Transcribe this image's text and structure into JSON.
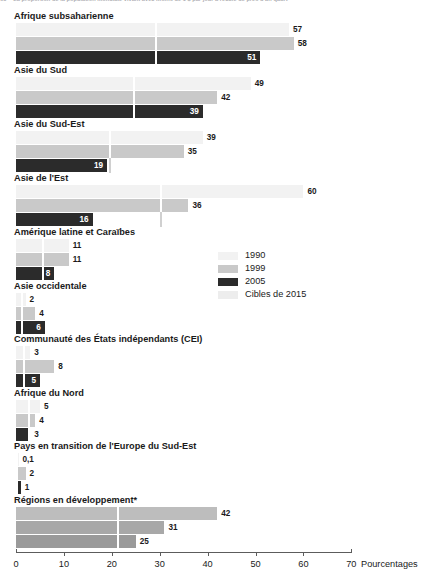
{
  "page": {
    "running_head_folio": "68",
    "running_head_text": "La proportion de la population mondiale vivant avec moins de 1 $ par jour a reculé de près d'un quart"
  },
  "chart_data": {
    "type": "bar",
    "orientation": "horizontal",
    "title": "",
    "xlabel": "Pourcentages",
    "ylabel": "",
    "xlim": [
      0,
      70
    ],
    "xticks": [
      0,
      10,
      20,
      30,
      40,
      50,
      60,
      70
    ],
    "xtick_labels": [
      "0",
      "10",
      "20",
      "30",
      "40",
      "50",
      "60",
      "70"
    ],
    "grid": false,
    "legend_position": "middle-right",
    "series": [
      {
        "name": "1990",
        "color": "#f2f2f2"
      },
      {
        "name": "1999",
        "color": "#c9c9c9"
      },
      {
        "name": "2005",
        "color": "#2b2b2b"
      }
    ],
    "target_marker": {
      "name": "Cibles de 2015",
      "color": "#ededed"
    },
    "categories": [
      "Afrique subsaharienne",
      "Asie du Sud",
      "Asie du Sud-Est",
      "Asie de l'Est",
      "Amérique latine et Caraïbes",
      "Asie occidentale",
      "Communauté des États indépendants (CEI)",
      "Afrique du Nord",
      "Pays en transition de l'Europe du Sud-Est",
      "Régions en développement*"
    ],
    "groups": [
      {
        "label": "Afrique subsaharienne",
        "target": 29,
        "highlight": false,
        "bars": [
          {
            "series": "1990",
            "value": 57,
            "label": "57"
          },
          {
            "series": "1999",
            "value": 58,
            "label": "58"
          },
          {
            "series": "2005",
            "value": 51,
            "label": "51"
          }
        ]
      },
      {
        "label": "Asie du Sud",
        "target": 24.5,
        "highlight": false,
        "bars": [
          {
            "series": "1990",
            "value": 49,
            "label": "49"
          },
          {
            "series": "1999",
            "value": 42,
            "label": "42"
          },
          {
            "series": "2005",
            "value": 39,
            "label": "39"
          }
        ]
      },
      {
        "label": "Asie du Sud-Est",
        "target": 19.5,
        "highlight": false,
        "bars": [
          {
            "series": "1990",
            "value": 39,
            "label": "39"
          },
          {
            "series": "1999",
            "value": 35,
            "label": "35"
          },
          {
            "series": "2005",
            "value": 19,
            "label": "19"
          }
        ]
      },
      {
        "label": "Asie de l'Est",
        "target": 30,
        "highlight": false,
        "bars": [
          {
            "series": "1990",
            "value": 60,
            "label": "60"
          },
          {
            "series": "1999",
            "value": 36,
            "label": "36"
          },
          {
            "series": "2005",
            "value": 16,
            "label": "16"
          }
        ]
      },
      {
        "label": "Amérique latine et Caraïbes",
        "target": 5.5,
        "highlight": false,
        "bars": [
          {
            "series": "1990",
            "value": 11,
            "label": "11"
          },
          {
            "series": "1999",
            "value": 11,
            "label": "11"
          },
          {
            "series": "2005",
            "value": 8,
            "label": "8"
          }
        ]
      },
      {
        "label": "Asie occidentale",
        "target": 1,
        "highlight": false,
        "bars": [
          {
            "series": "1990",
            "value": 2,
            "label": "2"
          },
          {
            "series": "1999",
            "value": 4,
            "label": "4"
          },
          {
            "series": "2005",
            "value": 6,
            "label": "6"
          }
        ]
      },
      {
        "label": "Communauté des États indépendants (CEI)",
        "target": 1.5,
        "highlight": false,
        "bars": [
          {
            "series": "1990",
            "value": 3,
            "label": "3"
          },
          {
            "series": "1999",
            "value": 8,
            "label": "8"
          },
          {
            "series": "2005",
            "value": 5,
            "label": "5"
          }
        ]
      },
      {
        "label": "Afrique du Nord",
        "target": 2.5,
        "highlight": false,
        "bars": [
          {
            "series": "1990",
            "value": 5,
            "label": "5"
          },
          {
            "series": "1999",
            "value": 4,
            "label": "4"
          },
          {
            "series": "2005",
            "value": 3,
            "label": "3"
          }
        ]
      },
      {
        "label": "Pays en transition de l'Europe du Sud-Est",
        "target": 0.05,
        "highlight": false,
        "bars": [
          {
            "series": "1990",
            "value": 0.1,
            "label": "0,1"
          },
          {
            "series": "1999",
            "value": 2,
            "label": "2"
          },
          {
            "series": "2005",
            "value": 1,
            "label": "1"
          }
        ]
      },
      {
        "label": "Régions en développement*",
        "target": 21,
        "highlight": true,
        "bars": [
          {
            "series": "1990",
            "value": 42,
            "label": "42"
          },
          {
            "series": "1999",
            "value": 31,
            "label": "31"
          },
          {
            "series": "2005",
            "value": 25,
            "label": "25"
          }
        ]
      }
    ],
    "legend": [
      {
        "label": "1990",
        "color": "#f2f2f2"
      },
      {
        "label": "1999",
        "color": "#c9c9c9"
      },
      {
        "label": "2005",
        "color": "#2b2b2b"
      },
      {
        "label": "Cibles de 2015",
        "color": "#ededed"
      }
    ]
  }
}
